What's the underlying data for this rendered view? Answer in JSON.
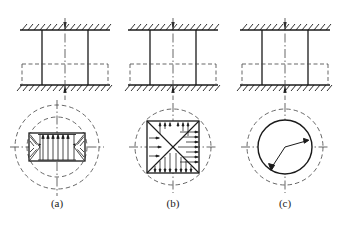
{
  "figure": {
    "background_color": "#ffffff",
    "line_color": "#1a1a1a",
    "dash_color": "#4d4d4d",
    "panel_count": 3
  },
  "panels": [
    {
      "id": "a",
      "caption": "(a)",
      "elevation": {
        "top_support": "hatched-fixed-support",
        "bottom_support": "hatched-fixed-support",
        "top_load_arrow": "down-arrow",
        "bottom_load_arrow": "up-arrow",
        "column_sides": 2,
        "centerline": "vertical-dash-dot",
        "hidden_outline": "dashed-rectangle"
      },
      "section": {
        "shape": "rectangle",
        "outer_rings": 2,
        "ring_style": "dashed-circle",
        "pressure_arrows": "uniform-upward-plus-end-triangles",
        "end_distribution": "triangular",
        "crosshair": "dash-dot"
      }
    },
    {
      "id": "b",
      "caption": "(b)",
      "elevation": {
        "top_support": "hatched-fixed-support",
        "bottom_support": "hatched-fixed-support",
        "top_load_arrow": "down-arrow",
        "bottom_load_arrow": "up-arrow",
        "column_sides": 2,
        "centerline": "vertical-dash-dot",
        "hidden_outline": "dashed-rectangle"
      },
      "section": {
        "shape": "square",
        "outer_rings": 1,
        "ring_style": "dashed-circle",
        "pressure_arrows": "diagonal-quadrant-hatching",
        "end_distribution": "diagonals",
        "crosshair": "dash-dot"
      }
    },
    {
      "id": "c",
      "caption": "(c)",
      "elevation": {
        "top_support": "hatched-fixed-support",
        "bottom_support": "hatched-fixed-support",
        "top_load_arrow": "down-arrow",
        "bottom_load_arrow": "up-arrow",
        "column_sides": 2,
        "centerline": "vertical-dash-dot",
        "hidden_outline": "dashed-rectangle"
      },
      "section": {
        "shape": "circle",
        "outer_rings": 1,
        "ring_style": "dashed-circle",
        "pressure_arrows": "two-radius-arrows",
        "end_distribution": "radial",
        "crosshair": "dash-dot"
      }
    }
  ]
}
